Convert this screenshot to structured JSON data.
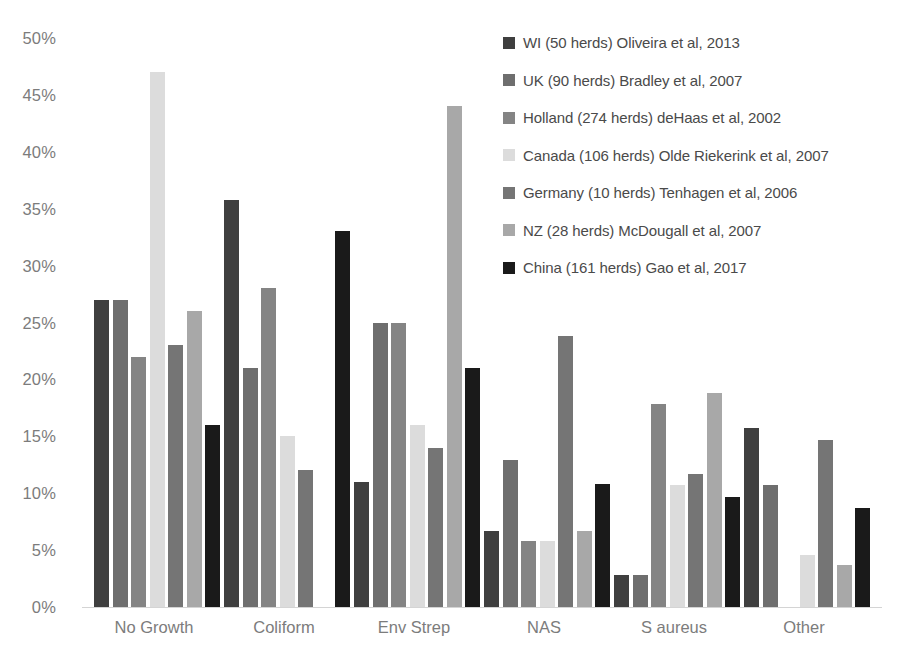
{
  "chart_data": {
    "type": "bar",
    "title": "",
    "xlabel": "",
    "ylabel": "",
    "ylim": [
      0,
      50
    ],
    "ytick_labels": [
      "50%",
      "45%",
      "40%",
      "35%",
      "30%",
      "25%",
      "20%",
      "15%",
      "10%",
      "5%",
      "0%"
    ],
    "ytick_values": [
      50,
      45,
      40,
      35,
      30,
      25,
      20,
      15,
      10,
      5,
      0
    ],
    "grid": false,
    "legend_position": "top-right",
    "categories": [
      "No Growth",
      "Coliform",
      "Env Strep",
      "NAS",
      "S aureus",
      "Other"
    ],
    "series": [
      {
        "name": "WI (50 herds) Oliveira et al, 2013",
        "color": "#3f3f3f",
        "values": [
          27.0,
          35.8,
          11.0,
          6.7,
          2.8,
          15.7
        ]
      },
      {
        "name": "UK (90 herds) Bradley et al, 2007",
        "color": "#6e6e6e",
        "values": [
          27.0,
          21.0,
          25.0,
          12.9,
          2.8,
          10.7
        ]
      },
      {
        "name": "Holland (274 herds)  deHaas et al, 2002",
        "color": "#848484",
        "values": [
          22.0,
          28.0,
          25.0,
          5.8,
          17.8,
          null
        ]
      },
      {
        "name": "Canada (106 herds) Olde Riekerink et al, 2007",
        "color": "#dcdcdc",
        "values": [
          47.0,
          15.0,
          16.0,
          5.8,
          10.7,
          4.6
        ]
      },
      {
        "name": "Germany (10 herds) Tenhagen et al, 2006",
        "color": "#757575",
        "values": [
          23.0,
          12.0,
          14.0,
          23.8,
          11.7,
          14.7
        ]
      },
      {
        "name": "NZ (28 herds)  McDougall et al, 2007",
        "color": "#a8a8a8",
        "values": [
          26.0,
          null,
          44.0,
          6.7,
          18.8,
          3.7
        ]
      },
      {
        "name": "China (161 herds) Gao et al, 2017",
        "color": "#1a1a1a",
        "values": [
          16.0,
          33.0,
          21.0,
          10.8,
          9.7,
          8.7
        ]
      }
    ]
  }
}
